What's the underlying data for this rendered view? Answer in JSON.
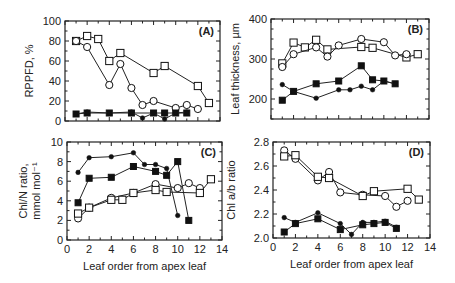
{
  "figure": {
    "width": 455,
    "height": 283
  },
  "chart_data": [
    {
      "type": "line",
      "panel_label": "(A)",
      "xlabel": "",
      "ylabel": "RPPFD, %",
      "xlim": [
        0,
        14
      ],
      "ylim": [
        0,
        100
      ],
      "yticks": [
        0,
        20,
        40,
        60,
        80,
        100
      ],
      "yminor": 10,
      "xticks": [
        0,
        2,
        4,
        6,
        8,
        10,
        12,
        14
      ],
      "show_xticklabels": false,
      "frame": {
        "x0": 65,
        "x1": 220,
        "y0": 21,
        "y1": 121
      },
      "series": [
        {
          "name": "open squares",
          "marker": "square",
          "filled": false,
          "x": [
            1,
            2,
            3,
            4,
            5,
            8,
            9,
            12,
            13
          ],
          "y": [
            80,
            85,
            82,
            60,
            68,
            48,
            55,
            35,
            18
          ]
        },
        {
          "name": "open circles",
          "marker": "circle",
          "filled": false,
          "x": [
            1,
            2,
            4,
            5,
            6,
            7,
            8,
            10,
            11,
            12
          ],
          "y": [
            80,
            74,
            36,
            57,
            33,
            16,
            20,
            13,
            16,
            12
          ]
        },
        {
          "name": "filled squares",
          "marker": "square",
          "filled": true,
          "x": [
            1,
            2,
            4,
            6,
            8,
            9,
            10,
            11
          ],
          "y": [
            7,
            8,
            8,
            8,
            8,
            8,
            8,
            8
          ]
        },
        {
          "name": "filled dots",
          "marker": "dot",
          "filled": true,
          "x": [
            1,
            2,
            4,
            6,
            7,
            8,
            9,
            10,
            11
          ],
          "y": [
            7,
            9,
            8,
            9,
            3,
            8,
            2,
            8,
            9
          ]
        }
      ]
    },
    {
      "type": "line",
      "panel_label": "(B)",
      "xlabel": "",
      "ylabel": "Leaf  thickness, µm",
      "xlim": [
        0,
        14
      ],
      "ylim": [
        150,
        400
      ],
      "yticks": [
        200,
        300,
        400
      ],
      "yminor": 25,
      "xticks": [
        0,
        2,
        4,
        6,
        8,
        10,
        12,
        14
      ],
      "show_xticklabels": false,
      "frame": {
        "x0": 271,
        "x1": 429,
        "y0": 19,
        "y1": 119
      },
      "series": [
        {
          "name": "open squares",
          "marker": "square",
          "filled": false,
          "x": [
            1,
            2,
            3,
            4,
            5,
            8,
            9,
            12,
            13
          ],
          "y": [
            289,
            341,
            329,
            348,
            324,
            330,
            328,
            304,
            312
          ]
        },
        {
          "name": "open circles",
          "marker": "circle",
          "filled": false,
          "x": [
            1,
            2,
            4,
            5,
            6,
            8,
            10,
            11,
            12
          ],
          "y": [
            280,
            312,
            329,
            306,
            334,
            350,
            342,
            309,
            312
          ]
        },
        {
          "name": "filled squares",
          "marker": "square",
          "filled": true,
          "x": [
            1,
            2,
            4,
            6,
            8,
            9,
            10,
            11
          ],
          "y": [
            197,
            219,
            238,
            245,
            283,
            248,
            245,
            238
          ]
        },
        {
          "name": "filled dots",
          "marker": "dot",
          "filled": true,
          "x": [
            1,
            2,
            4,
            6,
            7,
            8,
            9,
            10,
            11
          ],
          "y": [
            236,
            219,
            202,
            223,
            223,
            232,
            223,
            245,
            238
          ]
        }
      ]
    },
    {
      "type": "line",
      "panel_label": "(C)",
      "xlabel": "Leaf order from apex leaf",
      "ylabel": "Chl/N ratio,",
      "ylabel2": "mmol mol⁻¹",
      "xlim": [
        0,
        14
      ],
      "ylim": [
        0,
        10
      ],
      "yticks": [
        0,
        2,
        4,
        6,
        8,
        10
      ],
      "yminor": 1,
      "xticks": [
        0,
        2,
        4,
        6,
        8,
        10,
        12,
        14
      ],
      "show_xticklabels": true,
      "frame": {
        "x0": 67,
        "x1": 222,
        "y0": 142,
        "y1": 240
      },
      "series": [
        {
          "name": "filled dots",
          "marker": "dot",
          "filled": true,
          "x": [
            1,
            2,
            4,
            6,
            7,
            8,
            9,
            10
          ],
          "y": [
            6.9,
            8.4,
            8.5,
            8.9,
            7.7,
            7.7,
            7.3,
            2.5
          ]
        },
        {
          "name": "filled squares",
          "marker": "square",
          "filled": true,
          "x": [
            1,
            2,
            4,
            6,
            8,
            9,
            10,
            11
          ],
          "y": [
            3.8,
            6.3,
            6.4,
            7.5,
            7.0,
            6.6,
            8.0,
            2.0
          ]
        },
        {
          "name": "open circles",
          "marker": "circle",
          "filled": false,
          "x": [
            1,
            2,
            4,
            6,
            8,
            10,
            11,
            12
          ],
          "y": [
            2.2,
            3.3,
            4.3,
            4.8,
            5.7,
            5.3,
            5.8,
            5.3
          ]
        },
        {
          "name": "open squares",
          "marker": "square",
          "filled": false,
          "x": [
            1,
            2,
            4,
            5,
            6,
            8,
            9,
            12,
            13
          ],
          "y": [
            2.7,
            3.3,
            4.1,
            4.1,
            4.8,
            5.1,
            4.9,
            4.8,
            6.2
          ]
        }
      ]
    },
    {
      "type": "line",
      "panel_label": "(D)",
      "xlabel": "Leaf order from apex leaf",
      "ylabel": "Chl a/b ratio",
      "xlim": [
        0,
        14
      ],
      "ylim": [
        2.0,
        2.8
      ],
      "yticks": [
        2.0,
        2.2,
        2.4,
        2.6,
        2.8
      ],
      "yminor": 0.1,
      "xticks": [
        0,
        2,
        4,
        6,
        8,
        10,
        12,
        14
      ],
      "show_xticklabels": true,
      "frame": {
        "x0": 273,
        "x1": 430,
        "y0": 142,
        "y1": 238
      },
      "series": [
        {
          "name": "open circles",
          "marker": "circle",
          "filled": false,
          "x": [
            1,
            2,
            4,
            5,
            6,
            8,
            10,
            11,
            12
          ],
          "y": [
            2.73,
            2.66,
            2.48,
            2.55,
            2.38,
            2.36,
            2.35,
            2.26,
            2.31
          ]
        },
        {
          "name": "open squares",
          "marker": "square",
          "filled": false,
          "x": [
            1,
            2,
            4,
            5,
            8,
            9,
            12,
            13
          ],
          "y": [
            2.68,
            2.69,
            2.51,
            2.5,
            2.35,
            2.39,
            2.41,
            2.32
          ]
        },
        {
          "name": "filled dots",
          "marker": "dot",
          "filled": true,
          "x": [
            1,
            2,
            4,
            6,
            7,
            8,
            9,
            10,
            11
          ],
          "y": [
            2.17,
            2.13,
            2.21,
            2.12,
            2.03,
            2.13,
            2.13,
            2.14,
            2.09
          ]
        },
        {
          "name": "filled squares",
          "marker": "square",
          "filled": true,
          "x": [
            1,
            2,
            4,
            6,
            8,
            9,
            10,
            11
          ],
          "y": [
            2.05,
            2.12,
            2.16,
            2.07,
            2.11,
            2.12,
            2.13,
            2.08
          ]
        }
      ]
    }
  ]
}
